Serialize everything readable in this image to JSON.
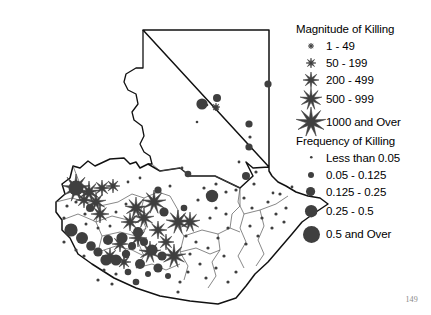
{
  "page": {
    "number": "149",
    "background_color": "#ffffff",
    "ink_color": "#000000",
    "marker_color": "#3f3f3f"
  },
  "legend": {
    "magnitude": {
      "title": "Magnitude of Killing",
      "classes": [
        {
          "label": "1 - 49",
          "symbol": "star-icon",
          "size": 3
        },
        {
          "label": "50 - 199",
          "symbol": "star-icon",
          "size": 5
        },
        {
          "label": "200 - 499",
          "symbol": "star-icon",
          "size": 8
        },
        {
          "label": "500 - 999",
          "symbol": "star-icon",
          "size": 11
        },
        {
          "label": "1000 and Over",
          "symbol": "star-icon",
          "size": 15
        }
      ]
    },
    "frequency": {
      "title": "Frequency of Killing",
      "classes": [
        {
          "label": "Less than 0.05",
          "symbol": "circle-icon",
          "size": 1.3
        },
        {
          "label": "0.05 - 0.125",
          "symbol": "circle-icon",
          "size": 3
        },
        {
          "label": "0.125 - 0.25",
          "symbol": "circle-icon",
          "size": 4.6
        },
        {
          "label": "0.25 - 0.5",
          "symbol": "circle-icon",
          "size": 6.2
        },
        {
          "label": "0.5 and Over",
          "symbol": "circle-icon",
          "size": 8.5
        }
      ]
    }
  },
  "chart_data": {
    "type": "map",
    "region": "Guatemala",
    "projection_note": "department outline map with graduated point symbols",
    "outline": "M103,14 L229,14 L229,151 L213,152 L206,146 L213,160 L200,172 L175,160 L150,160 L140,152 L120,155 L108,148 L100,152 L96,146 L90,148 L84,142 L70,143 L55,150 L48,145 L40,152 L33,150 L30,162 L22,168 L25,178 L16,186 L16,196 L22,204 L22,214 L30,222 L38,238 L52,248 L74,262 L96,272 L120,280 L150,285 L178,288 L196,282 L206,270 L215,258 L228,246 L240,232 L252,218 L262,206 L276,196 L288,188 L280,182 L268,180 L256,176 L246,170 L238,166 L232,160 L229,155 L229,151 Z",
    "peten_south_border": "M103,14 L103,52 L96,52 L86,58 L84,66 L88,74 L96,78 L98,88 L92,96 L94,104 L102,110 L104,120 L100,128 L104,136 L110,140 L112,148 L108,148",
    "department_boundaries": [
      "M112,148 L120,155 L140,152 L150,160 L175,160 L200,172",
      "M33,150 L40,168 L52,176 L60,190 L56,206 L62,220 L58,236",
      "M60,190 L78,186 L92,178 L104,182 L118,176 L130,180",
      "M104,182 L100,198 L106,212 L98,226 L104,240 L96,252",
      "M130,180 L138,194 L136,208 L144,220 L140,236 L148,250 L144,264",
      "M144,220 L162,214 L178,218 L190,212 L200,216",
      "M178,218 L180,234 L172,246 L176,260 L168,272",
      "M200,172 L198,186 L204,198 L200,212 L206,226 L198,240 L204,252",
      "M204,198 L220,194 L236,188 L248,180",
      "M220,194 L224,210 L218,224 L224,238 L216,250",
      "M56,206 L72,200 L88,204 L100,198",
      "M58,236 L76,230 L92,234 L104,240",
      "M62,220 L80,216 L96,220 L106,212",
      "M22,204 L38,198 L52,204 L56,206",
      "M16,186 L32,182 L46,186 L60,190",
      "M96,252 L112,248 L126,254 L140,248",
      "M140,236 L156,232 L170,238 L180,234",
      "M190,212 L192,198 L200,190 L200,172"
    ],
    "markers_star": [
      {
        "x": 176,
        "y": 91,
        "size": 4,
        "class": "50 - 199"
      },
      {
        "x": 176,
        "y": 92,
        "size": 3,
        "class": "1 - 49"
      },
      {
        "x": 36,
        "y": 172,
        "size": 14,
        "class": "1000 and Over"
      },
      {
        "x": 49,
        "y": 176,
        "size": 11,
        "class": "500 - 999"
      },
      {
        "x": 62,
        "y": 172,
        "size": 8,
        "class": "200 - 499"
      },
      {
        "x": 73,
        "y": 170,
        "size": 7,
        "class": "200 - 499"
      },
      {
        "x": 56,
        "y": 186,
        "size": 10,
        "class": "500 - 999"
      },
      {
        "x": 44,
        "y": 184,
        "size": 8,
        "class": "200 - 499"
      },
      {
        "x": 60,
        "y": 198,
        "size": 9,
        "class": "500 - 999"
      },
      {
        "x": 114,
        "y": 186,
        "size": 12,
        "class": "1000 and Over"
      },
      {
        "x": 96,
        "y": 192,
        "size": 11,
        "class": "500 - 999"
      },
      {
        "x": 104,
        "y": 202,
        "size": 10,
        "class": "500 - 999"
      },
      {
        "x": 138,
        "y": 206,
        "size": 12,
        "class": "1000 and Over"
      },
      {
        "x": 150,
        "y": 206,
        "size": 10,
        "class": "500 - 999"
      },
      {
        "x": 90,
        "y": 206,
        "size": 9,
        "class": "500 - 999"
      },
      {
        "x": 118,
        "y": 214,
        "size": 9,
        "class": "500 - 999"
      },
      {
        "x": 98,
        "y": 222,
        "size": 9,
        "class": "500 - 999"
      },
      {
        "x": 110,
        "y": 236,
        "size": 11,
        "class": "500 - 999"
      },
      {
        "x": 134,
        "y": 240,
        "size": 12,
        "class": "1000 and Over"
      },
      {
        "x": 80,
        "y": 228,
        "size": 8,
        "class": "200 - 499"
      },
      {
        "x": 70,
        "y": 240,
        "size": 8,
        "class": "200 - 499"
      },
      {
        "x": 84,
        "y": 246,
        "size": 7,
        "class": "200 - 499"
      },
      {
        "x": 126,
        "y": 226,
        "size": 8,
        "class": "200 - 499"
      }
    ],
    "markers_circle": [
      {
        "x": 177,
        "y": 82,
        "r": 4.0
      },
      {
        "x": 162,
        "y": 88,
        "r": 5.6
      },
      {
        "x": 167,
        "y": 89,
        "r": 1.3
      },
      {
        "x": 157,
        "y": 106,
        "r": 1.3
      },
      {
        "x": 228,
        "y": 68,
        "r": 3.6
      },
      {
        "x": 209,
        "y": 108,
        "r": 3.6
      },
      {
        "x": 210,
        "y": 121,
        "r": 1.6
      },
      {
        "x": 209,
        "y": 131,
        "r": 3.6
      },
      {
        "x": 148,
        "y": 158,
        "r": 3.3
      },
      {
        "x": 199,
        "y": 146,
        "r": 1.4
      },
      {
        "x": 233,
        "y": 177,
        "r": 1.4
      },
      {
        "x": 252,
        "y": 171,
        "r": 1.4
      },
      {
        "x": 36,
        "y": 172,
        "r": 7.5
      },
      {
        "x": 50,
        "y": 192,
        "r": 4.0
      },
      {
        "x": 36,
        "y": 186,
        "r": 1.6
      },
      {
        "x": 27,
        "y": 190,
        "r": 1.6
      },
      {
        "x": 45,
        "y": 198,
        "r": 1.6
      },
      {
        "x": 24,
        "y": 202,
        "r": 1.6
      },
      {
        "x": 31,
        "y": 214,
        "r": 6.6
      },
      {
        "x": 42,
        "y": 222,
        "r": 6.0
      },
      {
        "x": 24,
        "y": 226,
        "r": 1.6
      },
      {
        "x": 36,
        "y": 234,
        "r": 1.6
      },
      {
        "x": 51,
        "y": 230,
        "r": 4.8
      },
      {
        "x": 44,
        "y": 240,
        "r": 1.6
      },
      {
        "x": 58,
        "y": 236,
        "r": 4.6
      },
      {
        "x": 66,
        "y": 244,
        "r": 5.6
      },
      {
        "x": 76,
        "y": 244,
        "r": 5.6
      },
      {
        "x": 86,
        "y": 238,
        "r": 4.2
      },
      {
        "x": 68,
        "y": 224,
        "r": 5.0
      },
      {
        "x": 82,
        "y": 222,
        "r": 5.6
      },
      {
        "x": 92,
        "y": 230,
        "r": 4.0
      },
      {
        "x": 98,
        "y": 216,
        "r": 5.0
      },
      {
        "x": 104,
        "y": 226,
        "r": 4.0
      },
      {
        "x": 112,
        "y": 234,
        "r": 5.6
      },
      {
        "x": 122,
        "y": 240,
        "r": 4.6
      },
      {
        "x": 100,
        "y": 248,
        "r": 5.0
      },
      {
        "x": 88,
        "y": 256,
        "r": 3.3
      },
      {
        "x": 96,
        "y": 266,
        "r": 3.3
      },
      {
        "x": 108,
        "y": 258,
        "r": 3.0
      },
      {
        "x": 118,
        "y": 252,
        "r": 4.6
      },
      {
        "x": 128,
        "y": 260,
        "r": 3.0
      },
      {
        "x": 76,
        "y": 258,
        "r": 1.6
      },
      {
        "x": 64,
        "y": 254,
        "r": 1.6
      },
      {
        "x": 58,
        "y": 264,
        "r": 1.6
      },
      {
        "x": 72,
        "y": 268,
        "r": 1.6
      },
      {
        "x": 142,
        "y": 152,
        "r": 1.4
      },
      {
        "x": 88,
        "y": 166,
        "r": 1.4
      },
      {
        "x": 100,
        "y": 162,
        "r": 1.4
      },
      {
        "x": 76,
        "y": 196,
        "r": 1.5
      },
      {
        "x": 86,
        "y": 188,
        "r": 1.5
      },
      {
        "x": 70,
        "y": 210,
        "r": 1.5
      },
      {
        "x": 58,
        "y": 212,
        "r": 1.5
      },
      {
        "x": 46,
        "y": 208,
        "r": 1.5
      },
      {
        "x": 118,
        "y": 174,
        "r": 3.6
      },
      {
        "x": 130,
        "y": 170,
        "r": 1.5
      },
      {
        "x": 124,
        "y": 196,
        "r": 4.6
      },
      {
        "x": 144,
        "y": 192,
        "r": 3.3
      },
      {
        "x": 146,
        "y": 220,
        "r": 1.6
      },
      {
        "x": 156,
        "y": 226,
        "r": 1.6
      },
      {
        "x": 150,
        "y": 238,
        "r": 1.6
      },
      {
        "x": 160,
        "y": 248,
        "r": 1.6
      },
      {
        "x": 148,
        "y": 256,
        "r": 1.6
      },
      {
        "x": 140,
        "y": 266,
        "r": 1.6
      },
      {
        "x": 138,
        "y": 276,
        "r": 1.6
      },
      {
        "x": 164,
        "y": 172,
        "r": 1.6
      },
      {
        "x": 176,
        "y": 168,
        "r": 1.6
      },
      {
        "x": 172,
        "y": 180,
        "r": 6.2
      },
      {
        "x": 158,
        "y": 184,
        "r": 1.6
      },
      {
        "x": 186,
        "y": 176,
        "r": 1.6
      },
      {
        "x": 196,
        "y": 174,
        "r": 1.6
      },
      {
        "x": 176,
        "y": 192,
        "r": 1.6
      },
      {
        "x": 186,
        "y": 198,
        "r": 1.6
      },
      {
        "x": 170,
        "y": 202,
        "r": 1.6
      },
      {
        "x": 188,
        "y": 212,
        "r": 1.6
      },
      {
        "x": 178,
        "y": 222,
        "r": 1.6
      },
      {
        "x": 168,
        "y": 232,
        "r": 1.6
      },
      {
        "x": 184,
        "y": 240,
        "r": 1.6
      },
      {
        "x": 176,
        "y": 252,
        "r": 1.6
      },
      {
        "x": 166,
        "y": 262,
        "r": 1.6
      },
      {
        "x": 206,
        "y": 160,
        "r": 4.0
      },
      {
        "x": 216,
        "y": 156,
        "r": 1.6
      },
      {
        "x": 214,
        "y": 168,
        "r": 1.6
      },
      {
        "x": 204,
        "y": 182,
        "r": 1.6
      },
      {
        "x": 212,
        "y": 192,
        "r": 1.6
      },
      {
        "x": 222,
        "y": 202,
        "r": 1.6
      },
      {
        "x": 210,
        "y": 210,
        "r": 1.6
      },
      {
        "x": 218,
        "y": 220,
        "r": 1.6
      },
      {
        "x": 206,
        "y": 228,
        "r": 1.6
      },
      {
        "x": 228,
        "y": 186,
        "r": 1.6
      },
      {
        "x": 240,
        "y": 178,
        "r": 1.6
      },
      {
        "x": 236,
        "y": 198,
        "r": 1.6
      },
      {
        "x": 246,
        "y": 192,
        "r": 1.6
      },
      {
        "x": 232,
        "y": 212,
        "r": 1.6
      },
      {
        "x": 244,
        "y": 206,
        "r": 1.6
      },
      {
        "x": 196,
        "y": 256,
        "r": 1.6
      },
      {
        "x": 188,
        "y": 266,
        "r": 1.6
      }
    ]
  }
}
